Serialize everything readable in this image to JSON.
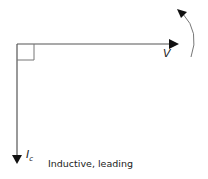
{
  "diagram": {
    "type": "phasor",
    "voltage_label": "V",
    "current_label": "I",
    "current_subscript": "c",
    "caption": "Inductive, leading",
    "rotation": "counter-clockwise",
    "colors": {
      "line": "#555555",
      "arrow": "#111111",
      "arc": "#777777"
    }
  }
}
